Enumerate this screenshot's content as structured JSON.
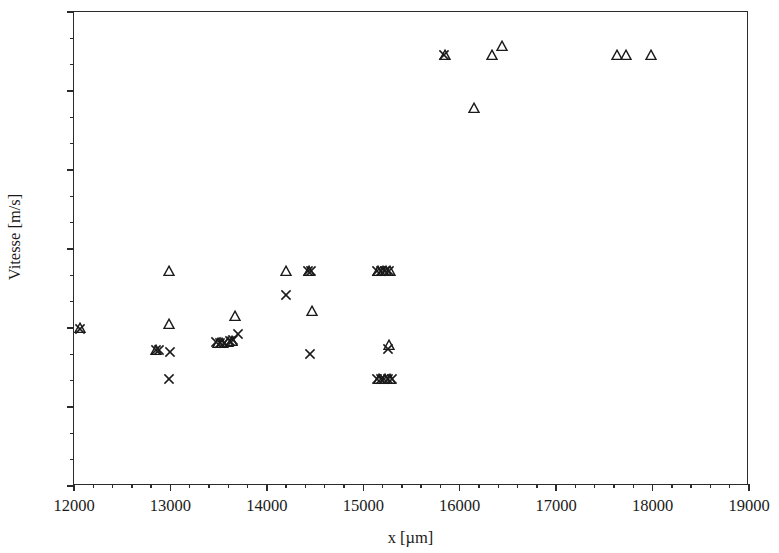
{
  "chart_data": {
    "type": "scatter",
    "title": "",
    "xlabel": "x [µm]",
    "ylabel": "Vitesse [m/s]",
    "xlim": [
      12000,
      19000
    ],
    "ylim": [
      0.0,
      0.06
    ],
    "xticks": [
      12000,
      13000,
      14000,
      15000,
      16000,
      17000,
      18000,
      19000
    ],
    "xtick_labels": [
      "12000",
      "13000",
      "14000",
      "15000",
      "16000",
      "17000",
      "18000",
      "19000"
    ],
    "yticks": [
      0.0,
      0.01,
      0.02,
      0.03,
      0.04,
      0.05,
      0.06
    ],
    "ytick_labels": [
      "0.00",
      "0.01",
      "0.02",
      "0.03",
      "0.04",
      "0.05",
      "0.06"
    ],
    "x_minor_ticks_per_interval": 4,
    "y_minor_ticks_per_interval": 2,
    "grid": false,
    "legend": null,
    "marker_color": "#1a1a1a",
    "series": [
      {
        "name": "triangle",
        "marker": "triangle-up-open",
        "points": [
          [
            12060,
            0.02
          ],
          [
            12990,
            0.0272
          ],
          [
            12990,
            0.0205
          ],
          [
            12850,
            0.0172
          ],
          [
            13490,
            0.0181
          ],
          [
            13530,
            0.0181
          ],
          [
            13600,
            0.0182
          ],
          [
            13640,
            0.0184
          ],
          [
            13670,
            0.0215
          ],
          [
            14200,
            0.0272
          ],
          [
            14440,
            0.0272
          ],
          [
            14470,
            0.0222
          ],
          [
            15150,
            0.0272
          ],
          [
            15200,
            0.0272
          ],
          [
            15240,
            0.0272
          ],
          [
            15280,
            0.0272
          ],
          [
            15270,
            0.0179
          ],
          [
            15160,
            0.0136
          ],
          [
            15230,
            0.0136
          ],
          [
            15280,
            0.0136
          ],
          [
            15850,
            0.0546
          ],
          [
            16150,
            0.0479
          ],
          [
            16330,
            0.0546
          ],
          [
            16440,
            0.0557
          ],
          [
            17630,
            0.0546
          ],
          [
            17720,
            0.0546
          ],
          [
            17980,
            0.0546
          ]
        ]
      },
      {
        "name": "cross",
        "marker": "x-cross",
        "points": [
          [
            12060,
            0.0199
          ],
          [
            12850,
            0.0172
          ],
          [
            12880,
            0.0172
          ],
          [
            13000,
            0.017
          ],
          [
            12990,
            0.0136
          ],
          [
            13470,
            0.0182
          ],
          [
            13510,
            0.0181
          ],
          [
            13560,
            0.0181
          ],
          [
            13620,
            0.0183
          ],
          [
            13650,
            0.0185
          ],
          [
            13700,
            0.0193
          ],
          [
            14200,
            0.0242
          ],
          [
            14430,
            0.0272
          ],
          [
            14460,
            0.0272
          ],
          [
            14450,
            0.0167
          ],
          [
            15140,
            0.0272
          ],
          [
            15180,
            0.0272
          ],
          [
            15230,
            0.0272
          ],
          [
            15270,
            0.0272
          ],
          [
            15260,
            0.0174
          ],
          [
            15140,
            0.0136
          ],
          [
            15180,
            0.0136
          ],
          [
            15210,
            0.0136
          ],
          [
            15260,
            0.0136
          ],
          [
            15300,
            0.0136
          ],
          [
            15840,
            0.0546
          ]
        ]
      }
    ]
  }
}
